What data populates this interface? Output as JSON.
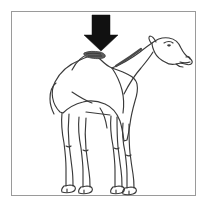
{
  "figure": {
    "type": "line-drawing-illustration",
    "subject_facing": "right",
    "background_color": "#ffffff",
    "border_color": "#9a9a9a",
    "outline_color": "#3a3a3a",
    "arrow_color": "#111111",
    "annotation": {
      "name": "down-arrow",
      "points_at": "hump",
      "direction": "down",
      "fill": "solid black"
    },
    "labels": {
      "border": "figure frame",
      "camel": "camel illustration",
      "arrow": "pointing arrow",
      "hump": "camel hump",
      "head": "camel head",
      "neck": "camel neck",
      "legs": "camel legs",
      "tail": "camel tail"
    },
    "caption": ""
  }
}
